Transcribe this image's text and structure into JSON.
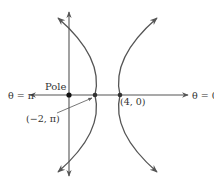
{
  "figure": {
    "type": "polar-hyperbola",
    "colors": {
      "stroke": "#555555",
      "point": "#222222",
      "text": "#333333"
    },
    "axes": {
      "polar_axis_right_label": "θ = 0",
      "polar_axis_left_label": "θ = π"
    },
    "points": [
      {
        "id": "pole",
        "label": "Pole"
      },
      {
        "id": "vertex-left",
        "label": "(−2, π)"
      },
      {
        "id": "vertex-right",
        "label": "(4, 0)"
      }
    ],
    "branches": [
      "left-branch",
      "right-branch"
    ]
  }
}
